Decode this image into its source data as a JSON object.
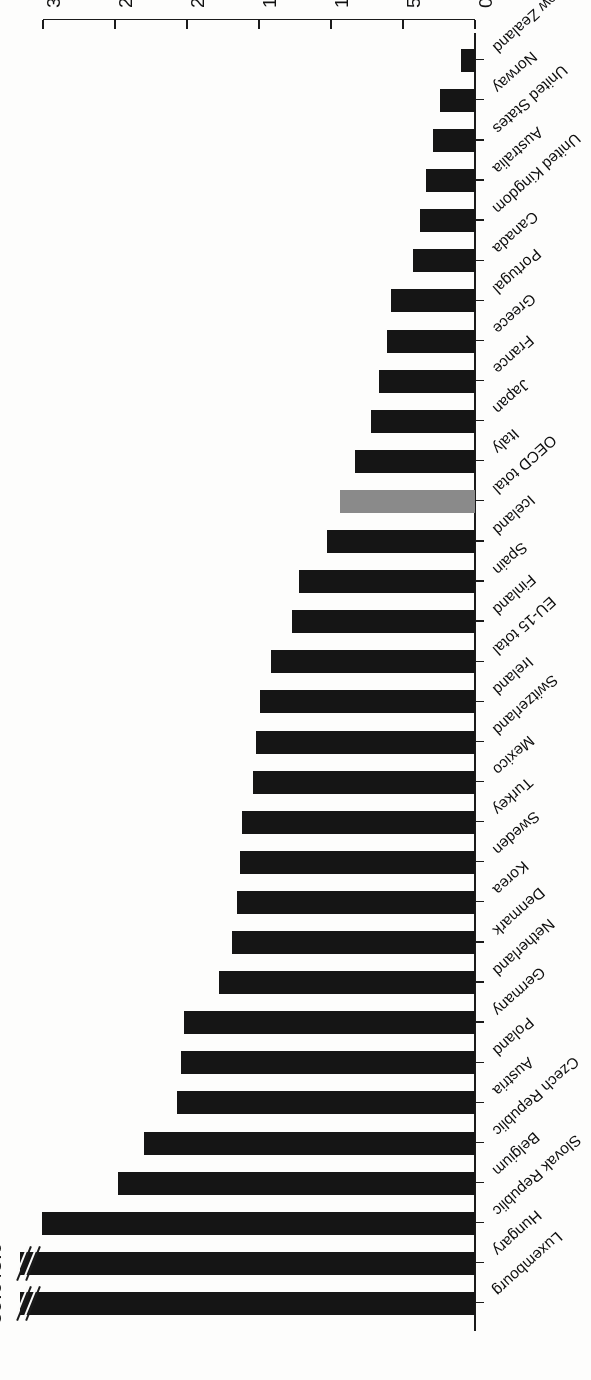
{
  "chart_data": {
    "type": "bar",
    "orientation": "horizontal",
    "title": "",
    "subtitle": "",
    "xlabel": "",
    "ylabel": "",
    "xlim": [
      0,
      30
    ],
    "grid": false,
    "legend": null,
    "tick_labels": [
      "0",
      "5",
      "10",
      "15",
      "20",
      "25",
      "30"
    ],
    "tick_values": [
      0,
      5,
      10,
      15,
      20,
      25,
      30
    ],
    "categories": [
      "Luxembourg",
      "Hungary",
      "Slovak Republic",
      "Belgium",
      "Czech Republic",
      "Austria",
      "Poland",
      "Germany",
      "Netherland",
      "Denmark",
      "Korea",
      "Sweden",
      "Turkey",
      "Mexico",
      "Switzerland",
      "Ireland",
      "EU-15 total",
      "Finland",
      "Spain",
      "Iceland",
      "OECD total",
      "Italy",
      "Japan",
      "France",
      "Greece",
      "Portugal",
      "Canada",
      "United Kingdom",
      "Australia",
      "United States",
      "Norway",
      "New Zealand"
    ],
    "values": [
      59.6,
      48.0,
      30.1,
      24.8,
      23.0,
      20.7,
      20.4,
      20.2,
      17.8,
      16.9,
      16.5,
      16.3,
      16.2,
      15.4,
      15.2,
      14.9,
      14.2,
      12.7,
      12.2,
      10.3,
      9.4,
      8.3,
      7.2,
      6.7,
      6.1,
      5.8,
      4.3,
      3.8,
      3.4,
      2.9,
      2.4,
      1.0
    ],
    "annotations": [
      {
        "category": "Luxembourg",
        "text": "59.6",
        "note": "bar truncated with axis break"
      },
      {
        "category": "Hungary",
        "text": "48.0",
        "note": "bar truncated with axis break"
      }
    ],
    "broken_bars": [
      "Luxembourg",
      "Hungary"
    ],
    "highlighted": [
      "OECD total"
    ],
    "colors": {
      "bar": "#151515",
      "highlight": "#8a8a8a",
      "axis": "#1b1b1b",
      "background": "#fdfdfc",
      "text": "#0d0d0d"
    }
  }
}
